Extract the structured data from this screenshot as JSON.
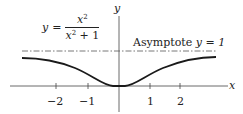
{
  "diagram": {
    "equation": {
      "lhs": "y",
      "equals": "=",
      "numerator_base": "x",
      "numerator_exp": "2",
      "denominator_base": "x",
      "denominator_exp": "2",
      "denominator_tail": " + 1"
    },
    "asymptote_label": "Asymptote",
    "asymptote_eq": "y = 1",
    "axis_x_label": "x",
    "axis_y_label": "y",
    "ticks": [
      {
        "label": "−2",
        "value": -2
      },
      {
        "label": "−1",
        "value": -1
      },
      {
        "label": "1",
        "value": 1
      },
      {
        "label": "2",
        "value": 2
      }
    ],
    "colors": {
      "curve": "#1a1a1a",
      "axis": "#444444",
      "asymptote": "#555555"
    }
  }
}
